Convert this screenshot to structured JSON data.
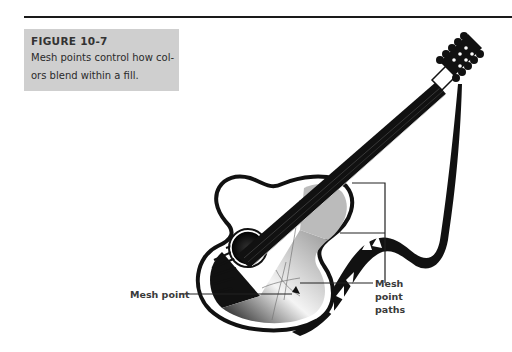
{
  "figure": {
    "title": "FIGURE 10-7",
    "caption_line1": "Mesh points control how col-",
    "caption_line2": "ors blend within a fill."
  },
  "callouts": {
    "mesh_point": "Mesh point",
    "mesh_point_paths_line1": "Mesh",
    "mesh_point_paths_line2": "point",
    "mesh_point_paths_line3": "paths"
  },
  "illustration": {
    "subject": "acoustic guitar with gradient mesh fill and ribbon strap",
    "colors": {
      "ink": "#111111",
      "caption_bg": "#cfcfcf",
      "label_text": "#3a3a3a"
    }
  }
}
